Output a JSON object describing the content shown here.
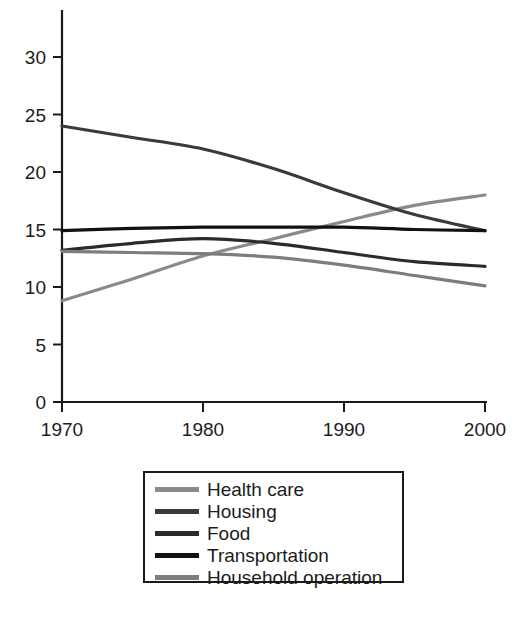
{
  "chart_data": {
    "type": "line",
    "title": "",
    "subtitle": "",
    "xlabel": "",
    "ylabel": "",
    "xlim": [
      1970,
      2000
    ],
    "ylim": [
      0,
      33
    ],
    "xticks": [
      1970,
      1980,
      1990,
      2000
    ],
    "yticks": [
      0,
      5,
      10,
      15,
      20,
      25,
      30
    ],
    "xtick_labels": [
      "1970",
      "1980",
      "1990",
      "2000"
    ],
    "ytick_labels": [
      "0",
      "5",
      "10",
      "15",
      "20",
      "25",
      "30"
    ],
    "grid": false,
    "legend_position": "below-center",
    "x": [
      1970,
      1975,
      1980,
      1985,
      1990,
      1995,
      2000
    ],
    "series": [
      {
        "name": "Health care",
        "color": "#8a8a8a",
        "values": [
          8.8,
          10.7,
          12.7,
          14.2,
          15.7,
          17.1,
          18.0
        ]
      },
      {
        "name": "Housing",
        "color": "#3a3a3a",
        "values": [
          24.0,
          23.0,
          22.0,
          20.3,
          18.2,
          16.3,
          14.9
        ]
      },
      {
        "name": "Food",
        "color": "#2b2b2b",
        "values": [
          13.2,
          13.8,
          14.2,
          13.8,
          13.0,
          12.2,
          11.8
        ]
      },
      {
        "name": "Transportation",
        "color": "#111111",
        "values": [
          14.9,
          15.1,
          15.2,
          15.2,
          15.2,
          15.0,
          14.9
        ]
      },
      {
        "name": "Household operation",
        "color": "#7d7d7d",
        "values": [
          13.1,
          13.0,
          12.9,
          12.6,
          11.9,
          11.0,
          10.1
        ]
      }
    ]
  },
  "legend": {
    "items": [
      {
        "label": "Health care"
      },
      {
        "label": "Housing"
      },
      {
        "label": "Food"
      },
      {
        "label": "Transportation"
      },
      {
        "label": "Household operation"
      }
    ]
  }
}
